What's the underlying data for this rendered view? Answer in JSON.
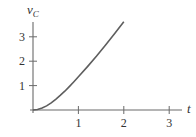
{
  "chart_data": {
    "type": "line",
    "title": "",
    "xlabel": "t",
    "ylabel": "v_C",
    "ylabel_main": "v",
    "ylabel_sub": "C",
    "xlim": [
      0,
      3.3
    ],
    "ylim": [
      0,
      3.7
    ],
    "x_ticks": [
      1,
      2,
      3
    ],
    "x_tick_labels": [
      "1",
      "2",
      "3"
    ],
    "y_ticks": [
      1,
      2,
      3
    ],
    "y_tick_labels": [
      "1",
      "2",
      "3"
    ],
    "grid": false,
    "legend": null,
    "series": [
      {
        "name": "v_C(t)",
        "x": [
          0,
          0.1,
          0.2,
          0.3,
          0.4,
          0.5,
          0.6,
          0.7,
          0.8,
          0.9,
          1.0,
          1.2,
          1.4,
          1.6,
          1.8,
          2.0
        ],
        "values": [
          0,
          0.02,
          0.08,
          0.17,
          0.29,
          0.44,
          0.6,
          0.77,
          0.96,
          1.16,
          1.36,
          1.78,
          2.21,
          2.66,
          3.13,
          3.62
        ]
      }
    ],
    "colors": {
      "axis": "#6a6a6a",
      "curve": "#5e5e5e",
      "text": "#333333"
    }
  }
}
